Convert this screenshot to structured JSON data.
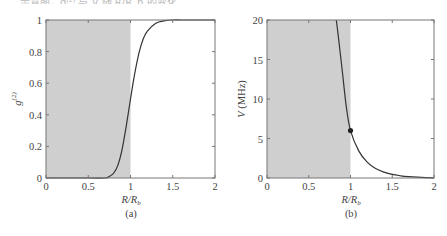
{
  "top_caption": "……示意图，g⁽²⁾ 与 V 随 R/R_b 的变化……",
  "chart_data": [
    {
      "type": "line",
      "panel": "(a)",
      "title": "",
      "xlabel": "R/R_b",
      "ylabel": "g^(2)",
      "xlim": [
        0,
        2
      ],
      "ylim": [
        0,
        1
      ],
      "xticks": [
        "0",
        "0.5",
        "1",
        "1.5",
        "2"
      ],
      "yticks": [
        "0",
        "0.2",
        "0.4",
        "0.6",
        "0.8",
        "1"
      ],
      "shaded_region": {
        "x": [
          0,
          1
        ],
        "color": "#cfcfcf"
      },
      "grid": false,
      "series": [
        {
          "name": "g2",
          "x": [
            0,
            0.5,
            0.7,
            0.75,
            0.8,
            0.85,
            0.9,
            0.95,
            1.0,
            1.05,
            1.1,
            1.15,
            1.2,
            1.3,
            1.4,
            1.5,
            1.6,
            1.8,
            2.0
          ],
          "y": [
            0,
            0,
            0.0,
            0.01,
            0.03,
            0.08,
            0.18,
            0.33,
            0.5,
            0.66,
            0.79,
            0.88,
            0.93,
            0.98,
            0.995,
            1.0,
            1.0,
            1.0,
            1.0
          ]
        }
      ]
    },
    {
      "type": "line",
      "panel": "(b)",
      "title": "",
      "xlabel": "R/R_b",
      "ylabel": "V (MHz)",
      "xlim": [
        0,
        2
      ],
      "ylim": [
        0,
        20
      ],
      "xticks": [
        "0",
        "0.5",
        "1",
        "1.5",
        "2"
      ],
      "yticks": [
        "0",
        "5",
        "10",
        "15",
        "20"
      ],
      "shaded_region": {
        "x": [
          0,
          1
        ],
        "color": "#cfcfcf"
      },
      "grid": false,
      "marker": {
        "x": 1.0,
        "y": 6.0
      },
      "series": [
        {
          "name": "V",
          "x": [
            0.83,
            0.85,
            0.9,
            0.95,
            1.0,
            1.1,
            1.2,
            1.3,
            1.4,
            1.5,
            1.6,
            1.7,
            1.8,
            1.9,
            2.0
          ],
          "y": [
            20,
            18.3,
            13.7,
            9.0,
            6.0,
            3.4,
            2.0,
            1.2,
            0.75,
            0.45,
            0.28,
            0.17,
            0.1,
            0.05,
            0.02
          ]
        }
      ]
    }
  ],
  "panels": {
    "a": {
      "label": "(a)",
      "xlabel_main": "R/R",
      "xlabel_sub": "b",
      "ylabel_main": "g",
      "ylabel_sup": "(2)"
    },
    "b": {
      "label": "(b)",
      "xlabel_main": "R/R",
      "xlabel_sub": "b",
      "ylabel_var": "V",
      "ylabel_unit": " (MHz)"
    }
  }
}
